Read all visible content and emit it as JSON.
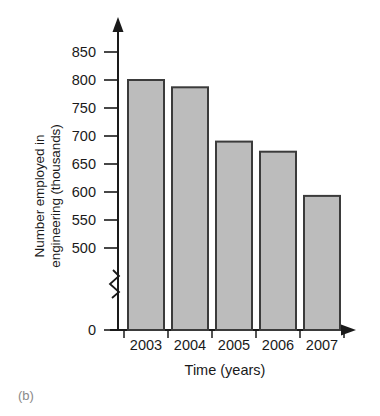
{
  "panel": {
    "label": "(b)"
  },
  "chart_data": {
    "type": "bar",
    "title": "",
    "subtitle": "",
    "xlabel": "Time (years)",
    "ylabel_lines": [
      "Number employed in",
      "engineering (thousands)"
    ],
    "ylabel": "Number employed in engineering (thousands)",
    "categories": [
      "2003",
      "2004",
      "2005",
      "2006",
      "2007"
    ],
    "values": [
      800,
      787,
      690,
      672,
      593
    ],
    "series": [
      {
        "name": "Number employed in engineering",
        "values": [
          800,
          787,
          690,
          672,
          593
        ]
      }
    ],
    "ylim": [
      500,
      870
    ],
    "yticks": [
      850,
      800,
      750,
      700,
      650,
      600,
      550,
      500
    ],
    "ytick_labels": [
      "850",
      "800",
      "750",
      "700",
      "650",
      "600",
      "550",
      "500"
    ],
    "zero_tick_label": "0",
    "axis_break": true,
    "axis_break_note": "zigzag break on y-axis between 0 and 500",
    "grid": false,
    "legend": "none",
    "bar_fill_color": "#bcbcbc",
    "bar_edge_color": "#3b3b3b",
    "axis_color": "#1a1a1a",
    "background_color": "#ffffff"
  }
}
